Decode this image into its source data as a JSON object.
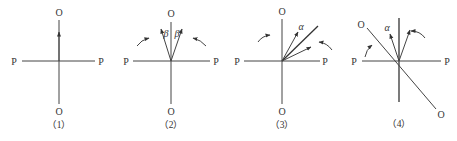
{
  "figure": {
    "colors": {
      "line": "#444444",
      "text": "#333333",
      "background": "#ffffff"
    },
    "panels": [
      {
        "caption": "（1）",
        "labels": {
          "top": "O",
          "bottom": "O",
          "left": "P",
          "right": "P"
        },
        "greek": []
      },
      {
        "caption": "（2）",
        "labels": {
          "top": "O",
          "bottom": "O",
          "left": "P",
          "right": "P"
        },
        "greek": [
          "β",
          "β"
        ]
      },
      {
        "caption": "（3）",
        "labels": {
          "top": "O",
          "bottom": "O",
          "left": "P",
          "right": "P"
        },
        "greek": [
          "α"
        ]
      },
      {
        "caption": "（4）",
        "labels": {
          "top": "O",
          "bottom": "O",
          "left": "P",
          "right": "P"
        },
        "greek": [
          "α"
        ]
      }
    ]
  }
}
